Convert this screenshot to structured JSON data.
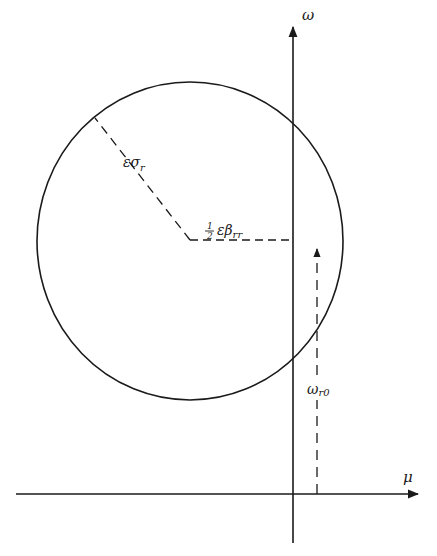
{
  "diagram": {
    "type": "circle-in-complex-plane",
    "axes": {
      "horizontal": {
        "label": "μ",
        "from": [
          16,
          494
        ],
        "to": [
          418,
          494
        ]
      },
      "vertical": {
        "label": "ω",
        "from": [
          293,
          543
        ],
        "to": [
          293,
          26
        ]
      }
    },
    "circle": {
      "cx": 190,
      "cy": 241,
      "rx": 153,
      "ry": 159
    },
    "radius_line": {
      "label_main": "εσ",
      "label_sub": "r",
      "from": [
        190,
        240
      ],
      "to": [
        95,
        118
      ]
    },
    "offset_line": {
      "label_frac_num": "1",
      "label_frac_den": "2",
      "label_main": "εβ",
      "label_sub": "rr",
      "from": [
        190,
        240
      ],
      "to": [
        293,
        240
      ]
    },
    "height_line": {
      "label_main": "ω",
      "label_sub": "r0",
      "x": 317,
      "from_y": 494,
      "to_y": 248
    }
  },
  "colors": {
    "ink": "#1a1a1a",
    "background": "#ffffff"
  }
}
